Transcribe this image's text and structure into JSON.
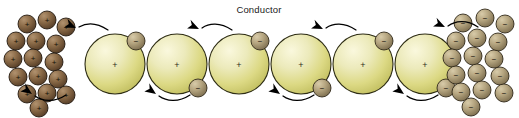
{
  "figure": {
    "title": "Conductor",
    "title_x": 259,
    "title_y": 13,
    "width": 519,
    "height": 118,
    "background": "#ffffff"
  },
  "colors": {
    "conductor_sphere_light": "#f4f2cc",
    "conductor_sphere_mid": "#dedc8e",
    "conductor_sphere_dark": "#b9b65c",
    "conductor_outline": "#2d2c14",
    "electron_light": "#cdbe9a",
    "electron_mid": "#a08f6a",
    "electron_dark": "#6e6046",
    "electron_outline": "#31291a",
    "proton_light": "#a98a6a",
    "proton_mid": "#80603f",
    "proton_dark": "#4e3824",
    "proton_outline": "#241a10",
    "arrow_color": "#000000",
    "text_color": "#1a1a1a"
  },
  "legend": {
    "positive_sign": "+",
    "negative_sign": "−"
  },
  "conductor_atoms": [
    {
      "id": "atom-1",
      "cx": 115,
      "cy": 64,
      "r": 30,
      "charge": "+",
      "electron": {
        "cx": 136,
        "cy": 41,
        "r": 9,
        "charge": "−"
      }
    },
    {
      "id": "atom-2",
      "cx": 177,
      "cy": 64,
      "r": 30,
      "charge": "+",
      "electron": {
        "cx": 198,
        "cy": 88,
        "r": 9,
        "charge": "−"
      }
    },
    {
      "id": "atom-3",
      "cx": 239,
      "cy": 64,
      "r": 30,
      "charge": "+",
      "electron": {
        "cx": 260,
        "cy": 41,
        "r": 9,
        "charge": "−"
      }
    },
    {
      "id": "atom-4",
      "cx": 301,
      "cy": 64,
      "r": 30,
      "charge": "+",
      "electron": {
        "cx": 322,
        "cy": 88,
        "r": 9,
        "charge": "−"
      }
    },
    {
      "id": "atom-5",
      "cx": 363,
      "cy": 64,
      "r": 30,
      "charge": "+",
      "electron": {
        "cx": 384,
        "cy": 41,
        "r": 9,
        "charge": "−"
      }
    },
    {
      "id": "atom-6",
      "cx": 425,
      "cy": 64,
      "r": 30,
      "charge": "+",
      "electron": {
        "cx": 446,
        "cy": 88,
        "r": 9,
        "charge": "−"
      }
    }
  ],
  "flow_arrows": [
    {
      "id": "arrow-top-1",
      "path": "M 108 30 C 96 22 86 23 79 27",
      "head_x": 76,
      "head_y": 28,
      "head_angle": 205,
      "direction": "left"
    },
    {
      "id": "arrow-bottom-1",
      "path": "M 190 95 C 178 103 166 101 159 96",
      "head_x": 156,
      "head_y": 94,
      "head_angle": 215,
      "direction": "left"
    },
    {
      "id": "arrow-top-2",
      "path": "M 232 30 C 220 22 209 23 202 28",
      "head_x": 199,
      "head_y": 29,
      "head_angle": 205,
      "direction": "left"
    },
    {
      "id": "arrow-bottom-2",
      "path": "M 314 95 C 302 103 290 101 283 96",
      "head_x": 280,
      "head_y": 94,
      "head_angle": 215,
      "direction": "left"
    },
    {
      "id": "arrow-top-3",
      "path": "M 356 30 C 344 22 333 23 326 28",
      "head_x": 323,
      "head_y": 29,
      "head_angle": 205,
      "direction": "left"
    },
    {
      "id": "arrow-bottom-3",
      "path": "M 438 95 C 426 103 414 101 407 96",
      "head_x": 404,
      "head_y": 94,
      "head_angle": 215,
      "direction": "left"
    },
    {
      "id": "arrow-top-source",
      "path": "M 478 27 C 466 19 455 21 448 26",
      "head_x": 445,
      "head_y": 27,
      "head_angle": 205,
      "direction": "left"
    },
    {
      "id": "arrow-bottom-sink",
      "path": "M 66 95 C 54 103 42 101 35 96",
      "head_x": 32,
      "head_y": 94,
      "head_angle": 215,
      "direction": "left"
    }
  ],
  "proton_cluster": {
    "label": "positive-charge-cluster",
    "charge": "+",
    "particles": [
      {
        "cx": 27,
        "cy": 24,
        "r": 9
      },
      {
        "cx": 47,
        "cy": 20,
        "r": 9
      },
      {
        "cx": 66,
        "cy": 27,
        "r": 9
      },
      {
        "cx": 16,
        "cy": 41,
        "r": 9
      },
      {
        "cx": 36,
        "cy": 41,
        "r": 9
      },
      {
        "cx": 56,
        "cy": 44,
        "r": 9
      },
      {
        "cx": 13,
        "cy": 59,
        "r": 9
      },
      {
        "cx": 33,
        "cy": 58,
        "r": 9
      },
      {
        "cx": 54,
        "cy": 62,
        "r": 9
      },
      {
        "cx": 18,
        "cy": 77,
        "r": 9
      },
      {
        "cx": 38,
        "cy": 76,
        "r": 9
      },
      {
        "cx": 58,
        "cy": 79,
        "r": 9
      },
      {
        "cx": 27,
        "cy": 94,
        "r": 9
      },
      {
        "cx": 47,
        "cy": 93,
        "r": 9
      },
      {
        "cx": 66,
        "cy": 95,
        "r": 9
      },
      {
        "cx": 39,
        "cy": 108,
        "r": 9
      }
    ]
  },
  "electron_cluster": {
    "label": "negative-charge-cluster",
    "charge": "−",
    "particles": [
      {
        "cx": 463,
        "cy": 23,
        "r": 9
      },
      {
        "cx": 485,
        "cy": 18,
        "r": 9
      },
      {
        "cx": 505,
        "cy": 24,
        "r": 9
      },
      {
        "cx": 456,
        "cy": 41,
        "r": 9
      },
      {
        "cx": 477,
        "cy": 38,
        "r": 9
      },
      {
        "cx": 498,
        "cy": 42,
        "r": 9
      },
      {
        "cx": 452,
        "cy": 58,
        "r": 9
      },
      {
        "cx": 473,
        "cy": 56,
        "r": 9
      },
      {
        "cx": 494,
        "cy": 59,
        "r": 9
      },
      {
        "cx": 456,
        "cy": 75,
        "r": 9
      },
      {
        "cx": 477,
        "cy": 73,
        "r": 9
      },
      {
        "cx": 500,
        "cy": 76,
        "r": 9
      },
      {
        "cx": 461,
        "cy": 92,
        "r": 9
      },
      {
        "cx": 482,
        "cy": 90,
        "r": 9
      },
      {
        "cx": 504,
        "cy": 93,
        "r": 9
      },
      {
        "cx": 471,
        "cy": 107,
        "r": 9
      }
    ]
  }
}
